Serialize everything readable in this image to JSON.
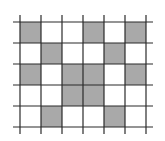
{
  "grid": {
    "rows": 5,
    "cols": 6,
    "origin_x": 20,
    "origin_y": 22,
    "cell_size": 21,
    "line_overhang": 7,
    "fill_color": "#a9a9a9",
    "line_color": "#2b2b2b",
    "cells": [
      [
        1,
        0,
        0,
        1,
        0,
        1
      ],
      [
        0,
        1,
        0,
        0,
        1,
        0
      ],
      [
        1,
        0,
        1,
        1,
        0,
        1
      ],
      [
        0,
        0,
        1,
        1,
        0,
        0
      ],
      [
        0,
        1,
        0,
        0,
        1,
        0
      ]
    ]
  }
}
